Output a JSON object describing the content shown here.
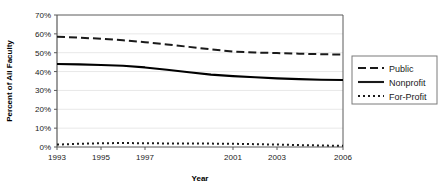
{
  "chart_data": {
    "type": "line",
    "title": "",
    "xlabel": "Year",
    "ylabel": "Percent of All Faculty",
    "xlim": [
      1993,
      2006
    ],
    "ylim": [
      0,
      70
    ],
    "ytick_labels": [
      "0%",
      "10%",
      "20%",
      "30%",
      "40%",
      "50%",
      "60%",
      "70%"
    ],
    "ytick_values": [
      0,
      10,
      20,
      30,
      40,
      50,
      60,
      70
    ],
    "xtick_labels": [
      "1993",
      "1995",
      "1997",
      "2001",
      "2003",
      "2006"
    ],
    "xtick_values": [
      1993,
      1995,
      1997,
      2001,
      2003,
      2006
    ],
    "x": [
      1993,
      1994,
      1995,
      1996,
      1997,
      1998,
      1999,
      2000,
      2001,
      2002,
      2003,
      2004,
      2005,
      2006
    ],
    "grid": "horizontal",
    "legend_position": "right",
    "series": [
      {
        "name": "Public",
        "style": "dashed",
        "color": "#1a1a1a",
        "values": [
          58.5,
          58.0,
          57.4,
          56.6,
          55.6,
          54.4,
          53.1,
          51.8,
          50.6,
          50.1,
          49.8,
          49.5,
          49.2,
          49.0
        ]
      },
      {
        "name": "Nonprofit",
        "style": "solid",
        "color": "#000000",
        "values": [
          44.0,
          43.8,
          43.5,
          43.1,
          42.2,
          41.0,
          39.6,
          38.4,
          37.6,
          37.0,
          36.4,
          36.0,
          35.7,
          35.5
        ]
      },
      {
        "name": "For-Profit",
        "style": "dotted",
        "color": "#1a1a1a",
        "values": [
          1.3,
          1.7,
          2.0,
          2.1,
          2.0,
          1.9,
          1.9,
          1.8,
          1.7,
          1.5,
          1.3,
          1.0,
          0.8,
          0.6
        ]
      }
    ]
  },
  "axes": {
    "x_title": "Year",
    "y_title": "Percent of All Faculty"
  },
  "legend": {
    "items": [
      {
        "label": "Public",
        "style": "dashed"
      },
      {
        "label": "Nonprofit",
        "style": "solid"
      },
      {
        "label": "For-Profit",
        "style": "dotted"
      }
    ]
  },
  "colors": {
    "axis": "#5a5a5a",
    "grid": "#e8e8e8",
    "line": "#1a1a1a",
    "text": "#1a1a1a",
    "background": "#ffffff",
    "legend_border": "#7a7a7a"
  }
}
